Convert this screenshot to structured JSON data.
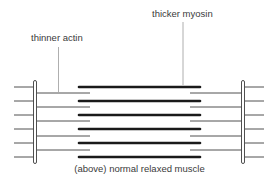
{
  "labels": {
    "actin": "thinner actin",
    "myosin": "thicker myosin",
    "caption": "(above) normal relaxed muscle"
  },
  "colors": {
    "background": "#ffffff",
    "filament": "#1a1a1a",
    "thin_line": "#3c3c3c",
    "leader": "#9a9a9a",
    "text": "#3a3a3a"
  },
  "geometry": {
    "myosin_rows": [
      87,
      101,
      115,
      129,
      143,
      157
    ],
    "actin_rows": [
      93,
      107,
      121,
      135,
      150
    ],
    "outer_rows": [
      87,
      101,
      115,
      129,
      143,
      157
    ]
  }
}
